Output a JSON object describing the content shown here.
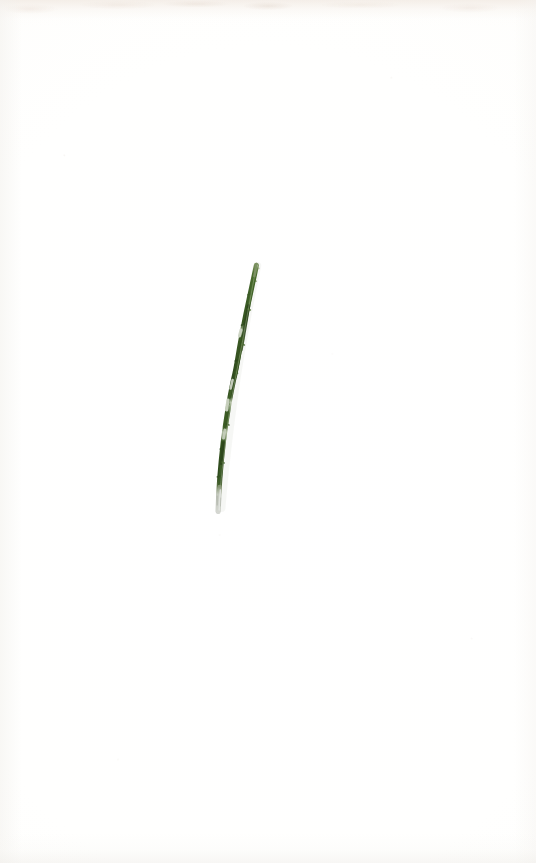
{
  "sheet": {
    "title": "Herbarium specimen sheet",
    "description": "Blank off-white paper sheet bearing a single pressed, slender grass-like plant specimen",
    "width": 536,
    "height": 863,
    "background_color": "#fefefd",
    "paper_tone": "#fffffe",
    "edge_shadow_color": "#ece1d7",
    "labels_present": "none",
    "annotations_present": "none",
    "scale_bar_present": "none"
  },
  "specimen": {
    "name": "pressed-grass-leaf",
    "common_description": "single slender leaf blade / stem, pressed and dried",
    "orientation": "diagonal, upper-right to lower-left",
    "colors": {
      "green_dark": "#2f4a1e",
      "green_mid": "#3d5e28",
      "green_light": "#567a38",
      "node_pale": "#cfd6c6",
      "base_gray": "#c9cbc4",
      "tip_pale": "#b9c4ac"
    },
    "geometry": {
      "tip_x": 256,
      "tip_y": 264,
      "base_x": 218,
      "base_y": 512,
      "length_px": 250,
      "max_width_px": 7
    },
    "segments": [
      {
        "name": "apex-tip",
        "from_y": 264,
        "to_y": 276,
        "tone": "green_light"
      },
      {
        "name": "upper-blade",
        "from_y": 276,
        "to_y": 330,
        "tone": "green_mid"
      },
      {
        "name": "upper-node",
        "from_y": 330,
        "to_y": 336,
        "tone": "node_pale"
      },
      {
        "name": "mid-blade",
        "from_y": 336,
        "to_y": 398,
        "tone": "green_dark"
      },
      {
        "name": "mid-node",
        "from_y": 398,
        "to_y": 414,
        "tone": "node_pale"
      },
      {
        "name": "lower-blade",
        "from_y": 414,
        "to_y": 430,
        "tone": "green_mid"
      },
      {
        "name": "lower-node",
        "from_y": 430,
        "to_y": 442,
        "tone": "node_pale"
      },
      {
        "name": "basal-blade",
        "from_y": 442,
        "to_y": 488,
        "tone": "green_dark"
      },
      {
        "name": "cut-base-stub",
        "from_y": 488,
        "to_y": 512,
        "tone": "base_gray"
      }
    ]
  }
}
